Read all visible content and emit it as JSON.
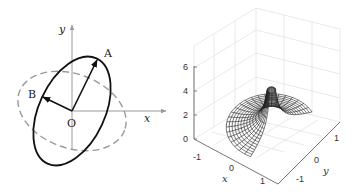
{
  "left_panel": {
    "title": "",
    "labels": {
      "y_axis": "y",
      "x_axis": "x",
      "origin": "O",
      "point_a": "A",
      "point_b": "B"
    },
    "colors": {
      "solid_ellipse": "#111111",
      "dashed_ellipse": "#9a9a9a",
      "axes": "#9a9a9a"
    }
  },
  "right_panel": {
    "z_ticks": [
      "0",
      "2",
      "4",
      "6"
    ],
    "x_ticks": [
      "-1",
      "0",
      "1"
    ],
    "y_ticks": [
      "-1",
      "0",
      "1"
    ],
    "x_label": "x",
    "y_label": "y",
    "colors": {
      "mesh": "#222222",
      "grid": "#e3e3e3",
      "axes": "#666666"
    }
  },
  "chart_data": {
    "type": "surface",
    "title": "",
    "xlabel": "x",
    "ylabel": "y",
    "zlabel": "",
    "xlim": [
      -1.5,
      1.5
    ],
    "ylim": [
      -1.5,
      1.5
    ],
    "zlim": [
      0,
      6
    ],
    "z_ticks": [
      0,
      2,
      4,
      6
    ],
    "x_ticks": [
      -1,
      0,
      1
    ],
    "y_ticks": [
      -1,
      0,
      1
    ],
    "grid": true
  }
}
